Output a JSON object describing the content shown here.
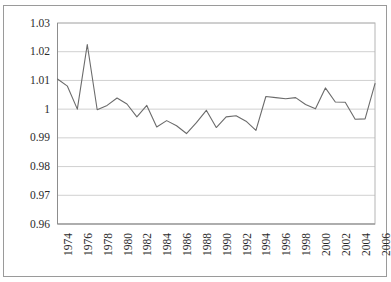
{
  "chart_data": {
    "type": "line",
    "title": "",
    "subtitle": "",
    "xlabel": "",
    "ylabel": "",
    "legend": [],
    "legend_position": "none",
    "grid": {
      "horizontal": true,
      "vertical": false,
      "color": "#d0d0d0"
    },
    "line_color": "#6b6b6b",
    "line_width": 1.1,
    "background_color": "#ffffff",
    "border_color": "#9a9a9a",
    "xlim": [
      1974,
      2006
    ],
    "ylim": [
      0.96,
      1.03
    ],
    "ytick_labels": [
      "1.03",
      "1.02",
      "1.01",
      "1",
      "0.99",
      "0.98",
      "0.97",
      "0.96"
    ],
    "ytick_values": [
      1.03,
      1.02,
      1.01,
      1.0,
      0.99,
      0.98,
      0.97,
      0.96
    ],
    "xtick_labels": [
      "1974",
      "1976",
      "1978",
      "1980",
      "1982",
      "1984",
      "1986",
      "1988",
      "1990",
      "1992",
      "1994",
      "1996",
      "1998",
      "2000",
      "2002",
      "2004",
      "2006"
    ],
    "xtick_values": [
      1974,
      1976,
      1978,
      1980,
      1982,
      1984,
      1986,
      1988,
      1990,
      1992,
      1994,
      1996,
      1998,
      2000,
      2002,
      2004,
      2006
    ],
    "x": [
      1974,
      1975,
      1976,
      1977,
      1978,
      1979,
      1980,
      1981,
      1982,
      1983,
      1984,
      1985,
      1986,
      1987,
      1988,
      1989,
      1990,
      1991,
      1992,
      1993,
      1994,
      1995,
      1996,
      1997,
      1998,
      1999,
      2000,
      2001,
      2002,
      2003,
      2004,
      2005,
      2006
    ],
    "values": [
      1.0105,
      1.008,
      1.0,
      1.0225,
      0.9998,
      1.0013,
      1.0039,
      1.0018,
      0.9973,
      1.0013,
      0.9938,
      0.996,
      0.9942,
      0.9915,
      0.9953,
      0.9996,
      0.9936,
      0.9973,
      0.9977,
      0.9958,
      0.9926,
      1.0044,
      1.004,
      1.0036,
      1.004,
      1.0016,
      1.0001,
      1.0074,
      1.0025,
      1.0024,
      0.9965,
      0.9966,
      1.0089
    ],
    "series": [
      {
        "name": "series-1",
        "values": [
          1.0105,
          1.008,
          1.0,
          1.0225,
          0.9998,
          1.0013,
          1.0039,
          1.0018,
          0.9973,
          1.0013,
          0.9938,
          0.996,
          0.9942,
          0.9915,
          0.9953,
          0.9996,
          0.9936,
          0.9973,
          0.9977,
          0.9958,
          0.9926,
          1.0044,
          1.004,
          1.0036,
          1.004,
          1.0016,
          1.0001,
          1.0074,
          1.0025,
          1.0024,
          0.9965,
          0.9966,
          1.0089
        ]
      }
    ]
  }
}
